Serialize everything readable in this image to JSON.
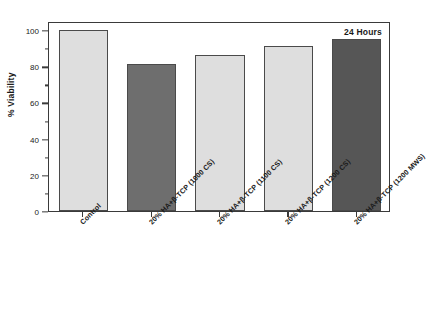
{
  "chart_data": {
    "type": "bar",
    "title": "",
    "annotation": "24 Hours",
    "xlabel": "",
    "ylabel": "% Viability",
    "ylim": [
      0,
      105
    ],
    "ymajor_ticks": [
      0,
      20,
      40,
      60,
      80,
      100
    ],
    "yminor_ticks": [
      10,
      30,
      50,
      70,
      90
    ],
    "grid": false,
    "legend": "none",
    "categories": [
      "Control",
      "20% HA+β-TCP (1000 CS)",
      "20% HA+β-TCP (1100 CS)",
      "20% HA+β-TCP (1200 CS)",
      "20% HA+β-TCP (1200 MWS)"
    ],
    "values": [
      100,
      81,
      86,
      91,
      95
    ],
    "bar_colors": [
      "#dedede",
      "#6e6e6e",
      "#dedede",
      "#dedede",
      "#565656"
    ],
    "bar_edge_color": "#4a4a4a",
    "axis_color": "#3a3a3a",
    "text_color": "#1a1a1a",
    "background": "#ffffff"
  },
  "axis": {
    "y_tick_labels": [
      "0",
      "20",
      "40",
      "60",
      "80",
      "100"
    ],
    "y_title": "% Viability"
  },
  "annotation": {
    "text": "24 Hours"
  }
}
